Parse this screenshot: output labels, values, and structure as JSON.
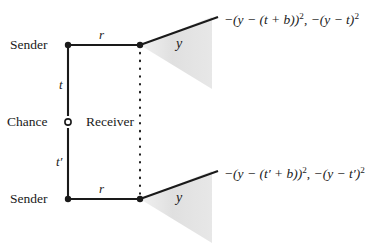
{
  "figure": {
    "type": "extensive-form-game-tree",
    "colors": {
      "line": "#1a1a1a",
      "text": "#1a1a1a",
      "cone_fill": "#e0e0e0",
      "background": "#ffffff"
    }
  },
  "nodes": {
    "chance": {
      "label": "Chance",
      "style": "hollow-circle",
      "x": 68,
      "y": 122
    },
    "sender_top": {
      "label": "Sender",
      "style": "filled-dot",
      "x": 68,
      "y": 45
    },
    "sender_bottom": {
      "label": "Sender",
      "style": "filled-dot",
      "x": 68,
      "y": 199
    },
    "receiver": {
      "label": "Receiver",
      "style": "filled-dot",
      "information_set": "dotted-line"
    }
  },
  "edges": {
    "chance_to_top": {
      "label": "t"
    },
    "chance_to_bottom": {
      "label": "t′"
    },
    "message_top": {
      "label": "r"
    },
    "message_bottom": {
      "label": "r"
    },
    "action_top": {
      "label": "y"
    },
    "action_bottom": {
      "label": "y"
    }
  },
  "payoffs": {
    "top": {
      "sender": "−(y − (t + b))²",
      "receiver": "−(y − t)²",
      "parts": {
        "a_pre": "−(y − (t + b))",
        "a_exp": "2",
        "sep": ", ",
        "b_pre": "−(y − t)",
        "b_exp": "2"
      }
    },
    "bottom": {
      "sender": "−(y − (t′ + b))²",
      "receiver": "−(y − t′)²",
      "parts": {
        "a_pre": "−(y − (t′ + b))",
        "a_exp": "2",
        "sep": ", ",
        "b_pre": "−(y − t′)",
        "b_exp": "2"
      }
    }
  }
}
